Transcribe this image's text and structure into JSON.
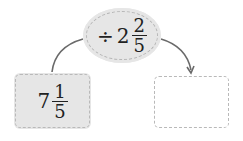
{
  "diagram": {
    "operation": {
      "operator": "÷",
      "whole": "2",
      "numerator": "2",
      "denominator": "5"
    },
    "input": {
      "whole": "7",
      "numerator": "1",
      "denominator": "5"
    },
    "output": {
      "value": ""
    },
    "colors": {
      "filled_background": "#e6e6e6",
      "dashed_border": "#b5b5b5",
      "arrow": "#666666"
    }
  }
}
